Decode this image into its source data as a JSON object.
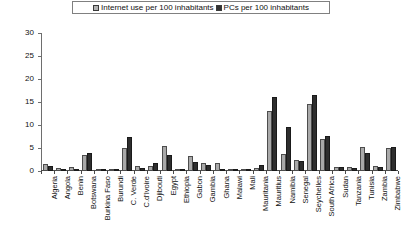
{
  "chart_data": {
    "type": "bar",
    "title": "",
    "xlabel": "",
    "ylabel": "",
    "ylim": [
      0,
      30
    ],
    "yticks": [
      0,
      5,
      10,
      15,
      20,
      25,
      30
    ],
    "grid": false,
    "legend_position": "top-center",
    "categories": [
      "Algeria",
      "Angola",
      "Benin",
      "Botswana",
      "Burkina Faso",
      "Burundi",
      "C. Verde",
      "C.d'Ivoire",
      "Djibouti",
      "Egypt",
      "Ethiopia",
      "Gabon",
      "Gambia",
      "Ghana",
      "Malawi",
      "Mali",
      "Mauritania",
      "Mauritius",
      "Namibia",
      "Senegal",
      "Seychelles",
      "South Africa",
      "Sudan",
      "Tanzania",
      "Tunisia",
      "Zambia",
      "Zimbabwe"
    ],
    "series": [
      {
        "name": "Internet use per 100  inhabitants",
        "color": "#a9a9a9",
        "values": [
          1.6,
          0.6,
          0.8,
          3.4,
          0.5,
          0.4,
          5.0,
          1.1,
          1.1,
          5.5,
          0.2,
          3.3,
          1.8,
          1.8,
          0.4,
          0.5,
          0.7,
          13.0,
          3.7,
          2.5,
          14.5,
          7.0,
          0.8,
          0.9,
          5.3,
          1.0,
          5.0
        ]
      },
      {
        "name": "PCs per 100 inhabitants",
        "color": "#2e2e2e",
        "values": [
          1.1,
          0.2,
          0.4,
          4.0,
          0.2,
          0.1,
          7.5,
          0.7,
          1.8,
          3.5,
          0.2,
          2.0,
          1.4,
          0.5,
          0.1,
          0.3,
          1.3,
          16.0,
          9.5,
          2.2,
          16.5,
          7.6,
          0.9,
          0.7,
          4.0,
          0.8,
          5.2
        ]
      }
    ]
  },
  "legend": {
    "items": [
      {
        "label": "Internet use per 100  inhabitants",
        "swatch": "light-gray-square"
      },
      {
        "label": "PCs per 100 inhabitants",
        "swatch": "dark-gray-square"
      }
    ]
  },
  "colors": {
    "internet": "#a9a9a9",
    "pcs": "#2e2e2e",
    "axis": "#4a4a4a",
    "background": "#ffffff"
  }
}
